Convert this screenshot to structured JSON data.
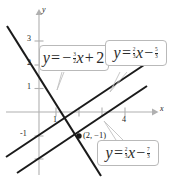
{
  "figure": {
    "type": "graph"
  },
  "axes": {
    "x_label": "x",
    "y_label": "y",
    "x_ticks": [
      {
        "value": "1",
        "at": 1
      },
      {
        "value": "4",
        "at": 4
      }
    ],
    "y_ticks": [
      {
        "value": "3",
        "at": 3
      },
      {
        "value": "2",
        "at": 2
      },
      {
        "value": "1",
        "at": 1
      },
      {
        "value": "-1",
        "at": -1
      }
    ],
    "x_range": [
      -2,
      5.6
    ],
    "y_range": [
      -3.2,
      3.9
    ],
    "axis_color": "#b0b0b0",
    "grid": false
  },
  "point": {
    "label": "(2, −1)",
    "x": 2,
    "y": -1,
    "marker": "dot"
  },
  "callouts": [
    {
      "id": "callout-line-1",
      "lhs": "y",
      "eq": "=",
      "sign": "−",
      "slope_num": "3",
      "slope_den": "2",
      "var": "x",
      "op": "+",
      "const_whole": "2",
      "const_num": "",
      "const_den": "",
      "text": "y = -3/2 x + 2"
    },
    {
      "id": "callout-line-2",
      "lhs": "y",
      "eq": "=",
      "sign": "",
      "slope_num": "2",
      "slope_den": "3",
      "var": "x",
      "op": "−",
      "const_whole": "",
      "const_num": "5",
      "const_den": "3",
      "text": "y = 2/3 x - 5/3"
    },
    {
      "id": "callout-line-3",
      "lhs": "y",
      "eq": "=",
      "sign": "",
      "slope_num": "2",
      "slope_den": "3",
      "var": "x",
      "op": "−",
      "const_whole": "",
      "const_num": "7",
      "const_den": "3",
      "text": "y = 2/3 x - 7/3"
    }
  ],
  "lines": [
    {
      "name": "line-steep-negative",
      "slope": -1.5,
      "intercept": 2,
      "color": "#1a1a1a"
    },
    {
      "name": "line-parallel-upper",
      "slope": 0.6667,
      "intercept": -1.6667,
      "color": "#1a1a1a"
    },
    {
      "name": "line-parallel-lower",
      "slope": 0.6667,
      "intercept": -2.3333,
      "color": "#1a1a1a"
    }
  ],
  "colors": {
    "ink": "#1a1a1a",
    "axis": "#b0b0b0",
    "callout_border": "#b9b9b9",
    "callout_bg": "#ffffff"
  }
}
